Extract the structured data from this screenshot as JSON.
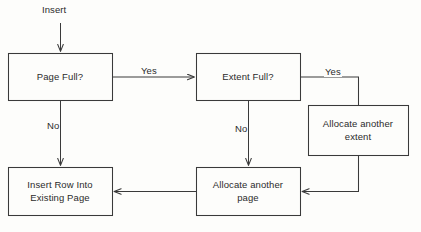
{
  "diagram": {
    "background_color": "#fdfdfb",
    "stroke_color": "#3a3a3a",
    "text_color": "#2b2b2b",
    "entry_label": "Insert",
    "nodes": [
      {
        "id": "page-full",
        "label": "Page Full?",
        "shape": "rectangle",
        "x": 8,
        "y": 53,
        "width": 104,
        "height": 47
      },
      {
        "id": "extent-full",
        "label": "Extent Full?",
        "shape": "rectangle",
        "x": 196,
        "y": 53,
        "width": 104,
        "height": 47
      },
      {
        "id": "allocate-another-extent",
        "label": "Allocate another\nextent",
        "shape": "rectangle",
        "x": 308,
        "y": 105,
        "width": 100,
        "height": 50
      },
      {
        "id": "allocate-another-page",
        "label": "Allocate another\npage",
        "shape": "rectangle",
        "x": 196,
        "y": 167,
        "width": 104,
        "height": 48
      },
      {
        "id": "insert-row-into-existing-page",
        "label": "Insert Row Into\nExisting Page",
        "shape": "rectangle",
        "x": 8,
        "y": 167,
        "width": 104,
        "height": 48
      }
    ],
    "edges": [
      {
        "id": "entry-to-page-full",
        "label": "",
        "from": "start",
        "to": "page-full"
      },
      {
        "id": "page-full-yes",
        "label": "Yes",
        "from": "page-full",
        "to": "extent-full"
      },
      {
        "id": "page-full-no",
        "label": "No",
        "from": "page-full",
        "to": "insert-row-into-existing-page"
      },
      {
        "id": "extent-full-yes",
        "label": "Yes",
        "from": "extent-full",
        "to": "allocate-another-extent"
      },
      {
        "id": "extent-full-no",
        "label": "No",
        "from": "extent-full",
        "to": "allocate-another-page"
      },
      {
        "id": "extent-to-page",
        "label": "",
        "from": "allocate-another-extent",
        "to": "allocate-another-page"
      },
      {
        "id": "page-to-insert-row",
        "label": "",
        "from": "allocate-another-page",
        "to": "insert-row-into-existing-page"
      }
    ],
    "edge_labels": {
      "page_full_yes": "Yes",
      "page_full_no": "No",
      "extent_full_yes": "Yes",
      "extent_full_no": "No"
    }
  }
}
